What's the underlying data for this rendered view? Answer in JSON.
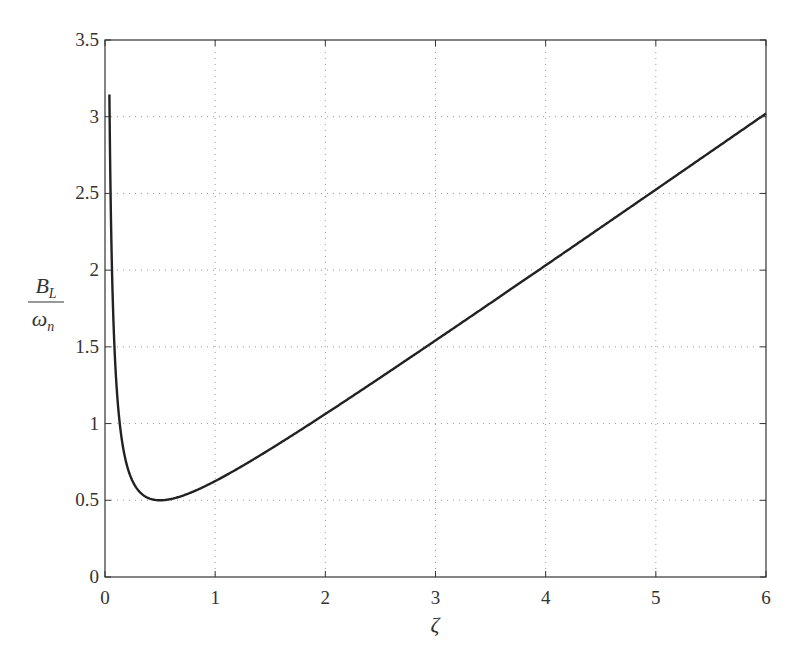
{
  "chart_data": {
    "type": "line",
    "title": "",
    "xlabel": "ζ",
    "ylabel": {
      "numerator": "B",
      "numerator_sub": "L",
      "denominator": "ω",
      "denominator_sub": "n"
    },
    "xlim": [
      0,
      6
    ],
    "ylim": [
      0,
      3.5
    ],
    "xticks": [
      0,
      1,
      2,
      3,
      4,
      5,
      6
    ],
    "xtick_labels": [
      "0",
      "1",
      "2",
      "3",
      "4",
      "5",
      "6"
    ],
    "yticks": [
      0,
      0.5,
      1,
      1.5,
      2,
      2.5,
      3,
      3.5
    ],
    "ytick_labels": [
      "0",
      "0.5",
      "1",
      "1.5",
      "2",
      "2.5",
      "3",
      "3.5"
    ],
    "grid": true,
    "grid_style": "dotted",
    "legend": null,
    "series": [
      {
        "name": "B_L/ω_n",
        "formula": "(ζ + 1/(4ζ))/2",
        "color": "#222222",
        "x": [
          0.04,
          0.06,
          0.08,
          0.1,
          0.15,
          0.2,
          0.3,
          0.4,
          0.5,
          0.6,
          0.8,
          1.0,
          1.5,
          2.0,
          2.5,
          3.0,
          3.5,
          4.0,
          4.5,
          5.0,
          5.5,
          6.0
        ],
        "y": [
          3.145,
          2.113,
          1.603,
          1.3,
          0.908,
          0.725,
          0.567,
          0.513,
          0.5,
          0.508,
          0.556,
          0.625,
          0.833,
          1.063,
          1.3,
          1.542,
          1.786,
          2.031,
          2.278,
          2.525,
          2.773,
          3.021
        ]
      }
    ]
  },
  "colors": {
    "axis": "#333333",
    "grid": "#999999",
    "line": "#222222",
    "background": "#ffffff"
  }
}
